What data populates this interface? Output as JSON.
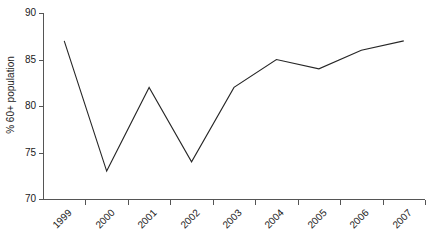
{
  "chart_data": {
    "type": "line",
    "title": "",
    "xlabel": "",
    "ylabel": "% 60+ population",
    "categories": [
      "1999",
      "2000",
      "2001",
      "2002",
      "2003",
      "2004",
      "2005",
      "2006",
      "2007"
    ],
    "values": [
      87,
      73,
      82,
      74,
      82,
      85,
      84,
      86,
      87
    ],
    "series": [
      {
        "name": "% 60+ population",
        "values": [
          87,
          73,
          82,
          74,
          82,
          85,
          84,
          86,
          87
        ]
      }
    ],
    "ylim": [
      70,
      90
    ],
    "yticks": [
      70,
      75,
      80,
      85,
      90
    ],
    "ytick_labels": [
      "70",
      "75",
      "80",
      "85",
      "90"
    ],
    "grid": false,
    "legend": false,
    "legend_position": "none",
    "line_color": "#262626",
    "axis_color": "#555555",
    "background_color": "#ffffff",
    "markers": false,
    "xtick_label_rotation": -45
  },
  "axis": {
    "y_title": "% 60+ population"
  }
}
